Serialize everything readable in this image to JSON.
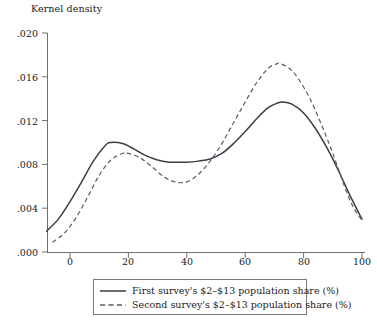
{
  "chart_data": {
    "type": "line",
    "title": "",
    "ylabel": "Kernel density",
    "xlabel": "",
    "xlim": [
      -10,
      103
    ],
    "ylim": [
      0.0,
      0.02
    ],
    "grid": false,
    "legend_position": "bottom-center",
    "x_ticks": [
      "0",
      "20",
      "40",
      "60",
      "80",
      "100"
    ],
    "x_tick_values": [
      0,
      20,
      40,
      60,
      80,
      100
    ],
    "y_ticks": [
      ".000",
      ".004",
      ".008",
      ".012",
      ".016",
      ".020"
    ],
    "y_tick_values": [
      0.0,
      0.004,
      0.008,
      0.012,
      0.016,
      0.02
    ],
    "series": [
      {
        "name": "First survey's $2–$13 population share (%)",
        "style": "solid",
        "color": "#3d3d4a",
        "x": [
          -8,
          -4,
          0,
          4,
          8,
          12,
          14,
          18,
          22,
          26,
          30,
          34,
          36,
          40,
          44,
          48,
          52,
          56,
          60,
          64,
          68,
          71,
          73,
          76,
          80,
          84,
          88,
          92,
          96,
          100
        ],
        "values": [
          0.0019,
          0.003,
          0.0046,
          0.0064,
          0.0083,
          0.0097,
          0.01,
          0.0099,
          0.0094,
          0.0088,
          0.0084,
          0.0082,
          0.0082,
          0.0082,
          0.0083,
          0.0085,
          0.009,
          0.0099,
          0.011,
          0.0122,
          0.0132,
          0.0136,
          0.0137,
          0.0135,
          0.0127,
          0.0113,
          0.0095,
          0.0074,
          0.0051,
          0.003
        ]
      },
      {
        "name": "Second survey's $2–$13 population share (%)",
        "style": "dashed",
        "color": "#5a5a66",
        "x": [
          -6,
          -2,
          2,
          6,
          10,
          14,
          18,
          20,
          24,
          28,
          32,
          36,
          40,
          44,
          48,
          52,
          56,
          60,
          64,
          68,
          71,
          72,
          75,
          78,
          82,
          86,
          90,
          94,
          97,
          100
        ],
        "values": [
          0.0009,
          0.0017,
          0.0031,
          0.005,
          0.007,
          0.0084,
          0.009,
          0.009,
          0.0086,
          0.0078,
          0.0069,
          0.0064,
          0.0064,
          0.0071,
          0.0083,
          0.0099,
          0.0118,
          0.0137,
          0.0155,
          0.0168,
          0.0172,
          0.0172,
          0.0168,
          0.0159,
          0.0141,
          0.0117,
          0.009,
          0.006,
          0.0041,
          0.0029
        ]
      }
    ]
  },
  "legend": {
    "entries": [
      {
        "label": "First survey's $2–$13 population share (%)",
        "style": "solid"
      },
      {
        "label": "Second survey's $2–$13 population share (%)",
        "style": "dashed"
      }
    ]
  }
}
